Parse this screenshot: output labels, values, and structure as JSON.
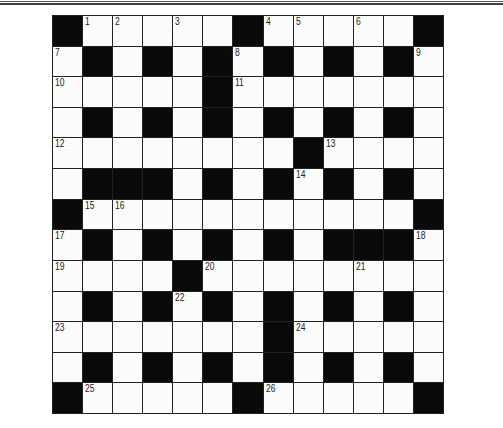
{
  "puzzle": {
    "rows": 13,
    "cols": 13,
    "legend": {
      "#": "block",
      ".": "open"
    },
    "grid": [
      [
        "#",
        "1",
        "2",
        ".",
        "3",
        ".",
        "#",
        "4",
        "5",
        ".",
        "6",
        ".",
        "#"
      ],
      [
        "7",
        "#",
        ".",
        "#",
        ".",
        "#",
        "8",
        "#",
        ".",
        "#",
        ".",
        "#",
        "9"
      ],
      [
        "10",
        ".",
        ".",
        ".",
        ".",
        "#",
        "11",
        ".",
        ".",
        ".",
        ".",
        ".",
        "."
      ],
      [
        ".",
        "#",
        ".",
        "#",
        ".",
        "#",
        ".",
        "#",
        ".",
        "#",
        ".",
        "#",
        "."
      ],
      [
        "12",
        ".",
        ".",
        ".",
        ".",
        ".",
        ".",
        ".",
        "#",
        "13",
        ".",
        ".",
        "."
      ],
      [
        ".",
        "#",
        "#",
        "#",
        ".",
        "#",
        ".",
        "#",
        "14",
        "#",
        ".",
        "#",
        "."
      ],
      [
        "#",
        "15",
        "16",
        ".",
        ".",
        ".",
        ".",
        ".",
        ".",
        ".",
        ".",
        ".",
        "#"
      ],
      [
        "17",
        "#",
        ".",
        "#",
        ".",
        "#",
        ".",
        "#",
        ".",
        "#",
        "#",
        "#",
        "18"
      ],
      [
        "19",
        ".",
        ".",
        ".",
        "#",
        "20",
        ".",
        ".",
        ".",
        ".",
        "21",
        ".",
        "."
      ],
      [
        ".",
        "#",
        ".",
        "#",
        "22",
        "#",
        ".",
        "#",
        ".",
        "#",
        ".",
        "#",
        "."
      ],
      [
        "23",
        ".",
        ".",
        ".",
        ".",
        ".",
        ".",
        "#",
        "24",
        ".",
        ".",
        ".",
        "."
      ],
      [
        ".",
        "#",
        ".",
        "#",
        ".",
        "#",
        ".",
        "#",
        ".",
        "#",
        ".",
        "#",
        "."
      ],
      [
        "#",
        "25",
        ".",
        ".",
        ".",
        ".",
        "#",
        "26",
        ".",
        ".",
        ".",
        ".",
        "#"
      ]
    ],
    "colors": {
      "block": "#0a0a0a",
      "open": "#fbfbfb",
      "gridline": "#222222",
      "number": "#222222"
    }
  }
}
